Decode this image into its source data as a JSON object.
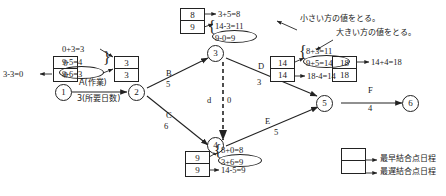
{
  "diagram": {
    "type": "pert-cpm-network",
    "nodes": [
      {
        "id": "1",
        "label": "1",
        "x": 63,
        "y": 84
      },
      {
        "id": "2",
        "label": "2",
        "x": 136,
        "y": 84
      },
      {
        "id": "3",
        "label": "3",
        "x": 215,
        "y": 45
      },
      {
        "id": "4",
        "label": "4",
        "x": 215,
        "y": 145
      },
      {
        "id": "5",
        "label": "5",
        "x": 323,
        "y": 95
      },
      {
        "id": "6",
        "label": "6",
        "x": 411,
        "y": 95
      }
    ],
    "edges": [
      {
        "name": "A",
        "duration": "3",
        "from": "1",
        "to": "2",
        "extra_label": "A(作業)",
        "extra_sub": "3(所要日数)"
      },
      {
        "name": "B",
        "duration": "5",
        "from": "2",
        "to": "3"
      },
      {
        "name": "C",
        "duration": "6",
        "from": "2",
        "to": "4"
      },
      {
        "name": "D",
        "duration": "3",
        "from": "3",
        "to": "5"
      },
      {
        "name": "E",
        "duration": "5",
        "from": "4",
        "to": "5"
      },
      {
        "name": "F",
        "duration": "4",
        "from": "5",
        "to": "6"
      },
      {
        "name": "d",
        "duration": "0",
        "from": "3",
        "to": "4",
        "dummy": true
      }
    ],
    "value_boxes": [
      {
        "for": "1",
        "earliest": "0",
        "latest": "0"
      },
      {
        "for": "2",
        "earliest": "3",
        "latest": "3"
      },
      {
        "for": "3",
        "earliest": "8",
        "latest": "9"
      },
      {
        "for": "4",
        "earliest": "9",
        "latest": "9"
      },
      {
        "for": "5",
        "earliest": "14",
        "latest": "14"
      },
      {
        "for": "6",
        "earliest": "18",
        "latest": "18"
      }
    ],
    "calculations": {
      "node1_latest": "3-3=0",
      "node2_earliest": "0+3=3",
      "node2_latest_a": "9-5=4",
      "node2_latest_b": "9-6=3",
      "node3_earliest": "3+5=8",
      "node3_latest_a": "14-3=11",
      "node3_latest_b": "9-0=9",
      "node4_earliest_a": "8+0=8",
      "node4_earliest_b": "3+6=9",
      "node4_latest": "14-5=9",
      "node5_earliest_a": "8+3=11",
      "node5_earliest_b": "9+5=14",
      "node5_latest": "18-4=14",
      "node6_earliest": "14+4=18"
    },
    "annotations": {
      "smaller": "小さい方の値をとる。",
      "larger": "大きい方の値をとる。"
    },
    "legend": {
      "earliest": "最早結合点日程",
      "latest": "最遅結合点日程"
    }
  }
}
